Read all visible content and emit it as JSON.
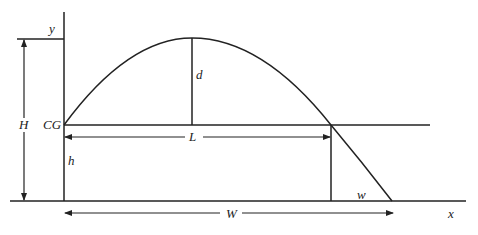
{
  "diagram": {
    "type": "projectile-trajectory",
    "labels": {
      "y_axis": "y",
      "x_axis": "x",
      "H": "H",
      "CG": "CG",
      "h": "h",
      "d": "d",
      "L": "L",
      "W": "W",
      "w": "w"
    },
    "colors": {
      "stroke": "#222222",
      "background": "#ffffff"
    }
  }
}
